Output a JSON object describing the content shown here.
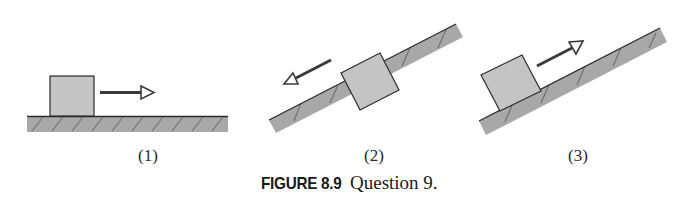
{
  "figure": {
    "caption_number": "FIGURE 8.9",
    "caption_text": "Question 9.",
    "colors": {
      "surface_fill": "#a8a8a8",
      "block_fill": "#c4c4c4",
      "outline": "#2b2b2b",
      "arrow": "#3a3a3a",
      "hatch": "#6e6e6e"
    },
    "panels": [
      {
        "label": "(1)",
        "surface": "horizontal",
        "block_position": "left",
        "velocity_arrow": "right"
      },
      {
        "label": "(2)",
        "surface": "incline rising to the right",
        "block_position": "middle",
        "velocity_arrow": "down the incline (left)"
      },
      {
        "label": "(3)",
        "surface": "incline rising to the right",
        "block_position": "bottom-left",
        "velocity_arrow": "up the incline (right)"
      }
    ]
  }
}
